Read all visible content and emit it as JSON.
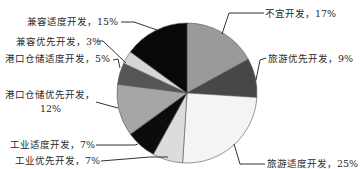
{
  "chart_data": {
    "type": "pie",
    "title": "",
    "start_angle_deg": 0,
    "direction": "clockwise",
    "slices": [
      {
        "label": "不宜开发",
        "value": 17,
        "display": "不宜开发，17%",
        "color": "#9a9a9a"
      },
      {
        "label": "旅游优先开发",
        "value": 9,
        "display": "旅游优先开发，9%",
        "color": "#474747"
      },
      {
        "label": "旅游适度开发",
        "value": 25,
        "display": "旅游适度开发，25%",
        "color": "#f4f4f4"
      },
      {
        "label": "工业优先开发",
        "value": 7,
        "display": "工业优先开发，7%",
        "color": "#dcdcdc"
      },
      {
        "label": "工业适度开发",
        "value": 7,
        "display": "工业适度开发，7%",
        "color": "#0c0c0c"
      },
      {
        "label": "港口仓储优先开发",
        "value": 12,
        "display": "港口仓储优先开发，12%",
        "color": "#a6a6a6"
      },
      {
        "label": "港口仓储适度开发",
        "value": 5,
        "display": "港口仓储适度开发，5%",
        "color": "#555555"
      },
      {
        "label": "兼容优先开发",
        "value": 3,
        "display": "兼容优先开发，3%",
        "color": "#d6d6d6"
      },
      {
        "label": "兼容适度开发",
        "value": 15,
        "display": "兼容适度开发，15%",
        "color": "#080808"
      }
    ],
    "legend": "none (callout labels with leader lines)"
  },
  "labels": {
    "buyi": "不宜开发，17%",
    "lvyou_youxian": "旅游优先开发，9%",
    "lvyou_shidu": "旅游适度开发，25%",
    "gongye_youxian": "工业优先开发，7%",
    "gongye_shidu": "工业适度开发，7%",
    "gangkou_youxian_line1": "港口仓储优先开发，",
    "gangkou_youxian_line2": "12%",
    "gangkou_shidu": "港口仓储适度开发，5%",
    "jianrong_youxian": "兼容优先开发，3%",
    "jianrong_shidu": "兼容适度开发，15%"
  }
}
